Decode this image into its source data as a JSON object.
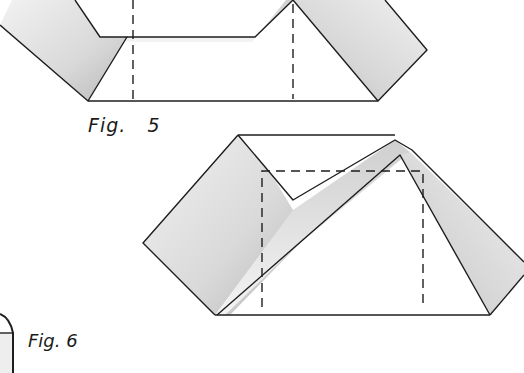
{
  "figures": [
    {
      "id": "fig5",
      "label": "Fig.   5"
    },
    {
      "id": "fig6",
      "label": "Fig. 6"
    }
  ],
  "colors": {
    "line": "#1e1e1e",
    "shade_dark": "#bdbdbd",
    "shade_light": "#e6e6e6",
    "background": "#ffffff"
  }
}
